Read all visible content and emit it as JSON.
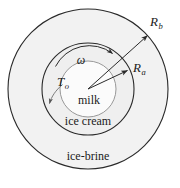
{
  "figure": {
    "background_color": "#ffffff",
    "stroke_color": "#2a2a2a",
    "text_color": "#1b1b1b"
  },
  "regions": {
    "outer": {
      "label": "ice-brine",
      "fill": "#f2f2f2",
      "radius": 80
    },
    "middle": {
      "label": "ice cream",
      "fill": "#efefef",
      "radius": 46
    },
    "inner": {
      "label": "milk",
      "fill": "#fbfbfb",
      "radius": 28
    }
  },
  "annotations": {
    "radius_outer": {
      "symbol": "R",
      "subscript": "b",
      "description": "outer radius arrow to ice-brine boundary"
    },
    "radius_inner": {
      "symbol": "R",
      "subscript": "a",
      "description": "inner radius arrow to ice cream boundary"
    },
    "angular_velocity": {
      "symbol": "ω",
      "description": "angular velocity curved arrow"
    },
    "temperature": {
      "symbol": "T",
      "subscript": "o",
      "description": "surface temperature callout arrow"
    }
  },
  "geometry": {
    "center_x": 88,
    "center_y": 89
  }
}
